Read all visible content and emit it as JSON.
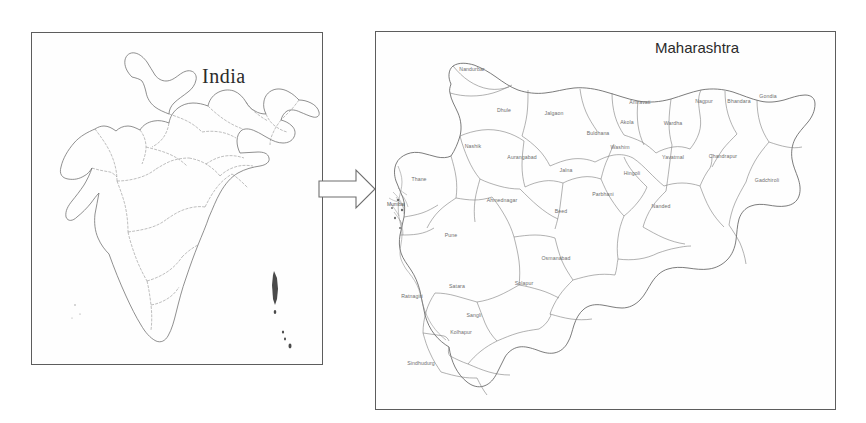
{
  "figure": {
    "kind": "two-panel-map-figure"
  },
  "arrow": {
    "icon": "right-arrow-icon",
    "direction": "right"
  },
  "india_panel": {
    "title": "India",
    "map_name": "india-outline-map"
  },
  "maharashtra_panel": {
    "title": "Maharashtra",
    "map_name": "maharashtra-district-map",
    "districts": [
      {
        "name": "Nandurbar",
        "x": 96,
        "y": 39
      },
      {
        "name": "Dhule",
        "x": 128,
        "y": 80
      },
      {
        "name": "Jalgaon",
        "x": 178,
        "y": 83
      },
      {
        "name": "Nashik",
        "x": 97,
        "y": 116
      },
      {
        "name": "Buldhana",
        "x": 222,
        "y": 103
      },
      {
        "name": "Akola",
        "x": 251,
        "y": 92
      },
      {
        "name": "Amravati",
        "x": 264,
        "y": 72
      },
      {
        "name": "Washim",
        "x": 244,
        "y": 117
      },
      {
        "name": "Wardha",
        "x": 297,
        "y": 93
      },
      {
        "name": "Nagpur",
        "x": 328,
        "y": 71
      },
      {
        "name": "Bhandara",
        "x": 363,
        "y": 71
      },
      {
        "name": "Gondia",
        "x": 392,
        "y": 66
      },
      {
        "name": "Yavatmal",
        "x": 297,
        "y": 127
      },
      {
        "name": "Chandrapur",
        "x": 347,
        "y": 126
      },
      {
        "name": "Gadchiroli",
        "x": 391,
        "y": 150
      },
      {
        "name": "Aurangabad",
        "x": 146,
        "y": 127
      },
      {
        "name": "Jalna",
        "x": 190,
        "y": 140
      },
      {
        "name": "Parbhani",
        "x": 227,
        "y": 164
      },
      {
        "name": "Hingoli",
        "x": 256,
        "y": 143
      },
      {
        "name": "Nanded",
        "x": 285,
        "y": 176
      },
      {
        "name": "Beed",
        "x": 185,
        "y": 181
      },
      {
        "name": "Thane",
        "x": 43,
        "y": 149
      },
      {
        "name": "Ahmednagar",
        "x": 126,
        "y": 170
      },
      {
        "name": "Pune",
        "x": 75,
        "y": 205
      },
      {
        "name": "Osmanabad",
        "x": 180,
        "y": 228
      },
      {
        "name": "Solapur",
        "x": 148,
        "y": 253
      },
      {
        "name": "Satara",
        "x": 81,
        "y": 256
      },
      {
        "name": "Ratnagiri",
        "x": 36,
        "y": 266
      },
      {
        "name": "Sangli",
        "x": 98,
        "y": 285
      },
      {
        "name": "Kolhapur",
        "x": 85,
        "y": 302
      },
      {
        "name": "Sindhudurg",
        "x": 45,
        "y": 333
      },
      {
        "name": "Mumbai",
        "x": 20,
        "y": 174
      }
    ]
  }
}
